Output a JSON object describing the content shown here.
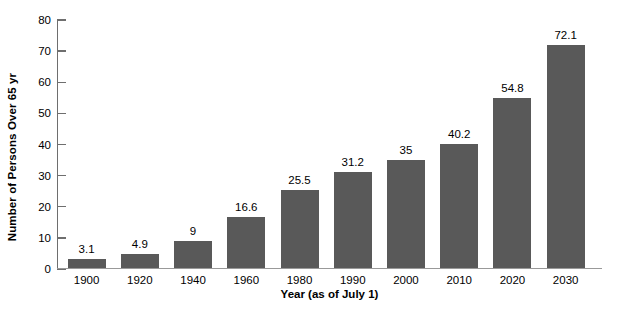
{
  "chart_data": {
    "type": "bar",
    "title": "",
    "subtitle": "",
    "xlabel": "Year (as of July 1)",
    "ylabel": "Number of Persons Over 65 yr",
    "categories": [
      "1900",
      "1920",
      "1940",
      "1960",
      "1980",
      "1990",
      "2000",
      "2010",
      "2020",
      "2030"
    ],
    "values": [
      3.1,
      4.9,
      9,
      16.6,
      25.5,
      31.2,
      35,
      40.2,
      54.8,
      72.1
    ],
    "value_labels": [
      "3.1",
      "4.9",
      "9",
      "16.6",
      "25.5",
      "31.2",
      "35",
      "40.2",
      "54.8",
      "72.1"
    ],
    "ylim": [
      0,
      80
    ],
    "xlim_note": "categorical",
    "y_ticks": [
      0,
      10,
      20,
      30,
      40,
      50,
      60,
      70,
      80
    ],
    "y_tick_labels": [
      "0",
      "10",
      "20",
      "30",
      "40",
      "50",
      "60",
      "70",
      "80"
    ],
    "grid": false,
    "legend": null,
    "legend_position": "none",
    "series": [
      {
        "name": "Number of Persons Over 65 yr",
        "values": [
          3.1,
          4.9,
          9,
          16.6,
          25.5,
          31.2,
          35,
          40.2,
          54.8,
          72.1
        ]
      }
    ],
    "colors": {
      "bar_fill": "#595959",
      "axis_line": "#6e6e6e",
      "x_axis_line": "#999999",
      "text": "#000000",
      "background": "#ffffff"
    },
    "annotations": []
  }
}
